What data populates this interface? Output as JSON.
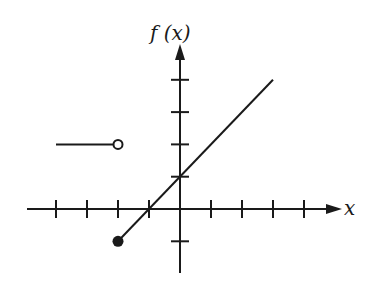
{
  "chart_data": {
    "type": "line",
    "title": "",
    "xlabel": "x",
    "ylabel": "f (x)",
    "xlim": [
      -5,
      5
    ],
    "ylim": [
      -2,
      5
    ],
    "x_ticks": [
      -4,
      -3,
      -2,
      -1,
      1,
      2,
      3,
      4
    ],
    "y_ticks": [
      -1,
      1,
      2,
      3,
      4
    ],
    "grid": false,
    "legend": null,
    "series": [
      {
        "name": "piece-1",
        "description": "f(x) = 2 for x < -2",
        "points": [
          [
            -4,
            2
          ],
          [
            -2,
            2
          ]
        ],
        "start_marker": "none",
        "end_marker": "open"
      },
      {
        "name": "piece-2",
        "description": "f(x) = x + 1 for x >= -2",
        "points": [
          [
            -2,
            -1
          ],
          [
            3,
            4
          ]
        ],
        "start_marker": "closed",
        "end_marker": "none"
      }
    ]
  },
  "colors": {
    "ink": "#1a1a1a",
    "background": "#ffffff"
  },
  "labels": {
    "x_axis": "x",
    "y_axis": "f (x)"
  }
}
